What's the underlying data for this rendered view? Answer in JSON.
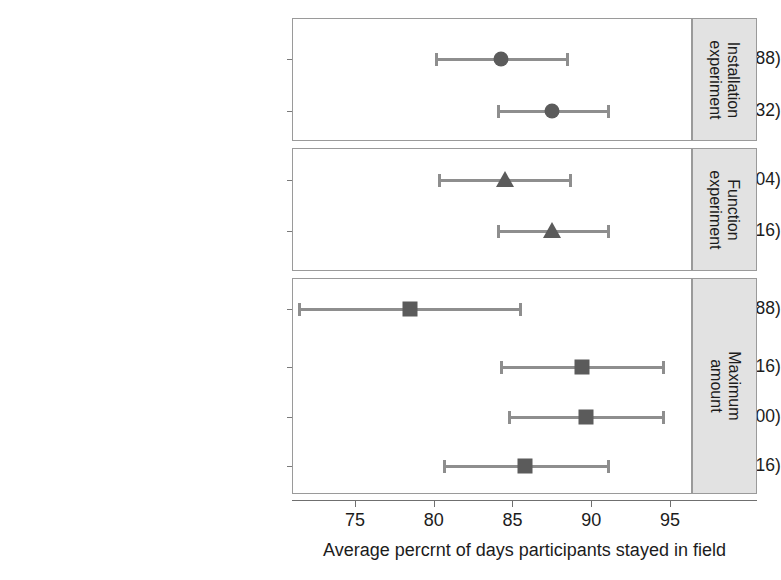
{
  "chart_data": {
    "type": "scatter",
    "title": "",
    "xlabel": "Average percrnt of days participants stayed in field",
    "ylabel": "",
    "xlim": [
      71.0,
      96.4
    ],
    "xticks": [
      75,
      80,
      85,
      90,
      95
    ],
    "xtick_labels": [
      "75",
      "80",
      "85",
      "90",
      "95"
    ],
    "grid": false,
    "legend": "none",
    "orientation": "horizontal",
    "panels": [
      {
        "strip_label": "Installation experiment",
        "marker": "circle",
        "rows": [
          {
            "label": "€10 for installation (N = 188)",
            "label_prefix": "€10 for installation (",
            "label_italic": "N",
            "label_suffix": " = 188)",
            "estimate": 84.3,
            "ci_low": 80.1,
            "ci_high": 88.6,
            "n": 188
          },
          {
            "label": "€20 for installation (N = 232)",
            "label_prefix": "€20 for installation (",
            "label_italic": "N",
            "label_suffix": " = 232)",
            "estimate": 87.5,
            "ci_low": 84.0,
            "ci_high": 91.2,
            "n": 232
          }
        ]
      },
      {
        "strip_label": "Function experiment",
        "marker": "triangle",
        "rows": [
          {
            "label": "Regular (N = 204)",
            "label_prefix": "Regular (",
            "label_italic": "N",
            "label_suffix": " = 204)",
            "estimate": 84.5,
            "ci_low": 80.3,
            "ci_high": 88.8,
            "n": 204
          },
          {
            "label": "Bonus (N = 216)",
            "label_prefix": "Bonus (",
            "label_italic": "N",
            "label_suffix": " = 216)",
            "estimate": 87.5,
            "ci_low": 84.0,
            "ci_high": 91.2,
            "n": 216
          }
        ]
      },
      {
        "strip_label": "Maximum amount",
        "marker": "square",
        "rows": [
          {
            "label": "€60 overall (N = 88)",
            "label_prefix": "€60 overall (",
            "label_italic": "N",
            "label_suffix": " = 88)",
            "estimate": 78.5,
            "ci_low": 71.4,
            "ci_high": 85.6,
            "n": 88
          },
          {
            "label": "€70 overall (N = 116)",
            "label_prefix": "€70 overall (",
            "label_italic": "N",
            "label_suffix": " = 116)",
            "estimate": 89.4,
            "ci_low": 84.2,
            "ci_high": 94.7,
            "n": 116
          },
          {
            "label": "€90 overall (N = 100)",
            "label_prefix": "€90 overall (",
            "label_italic": "N",
            "label_suffix": " = 100)",
            "estimate": 89.7,
            "ci_low": 84.7,
            "ci_high": 94.7,
            "n": 100
          },
          {
            "label": "€100 overall (N = 116)",
            "label_prefix": "€100 overall (",
            "label_italic": "N",
            "label_suffix": " = 116)",
            "estimate": 85.8,
            "ci_low": 80.6,
            "ci_high": 91.2,
            "n": 116
          }
        ]
      }
    ]
  },
  "colors": {
    "marker": "#5b5b5b",
    "errorbar": "#8e8e8e",
    "panel_border": "#9a9a9a",
    "strip_background": "#e2e2e2",
    "text": "#1c1c1c",
    "axis": "#6f6f6f",
    "background": "#ffffff"
  }
}
